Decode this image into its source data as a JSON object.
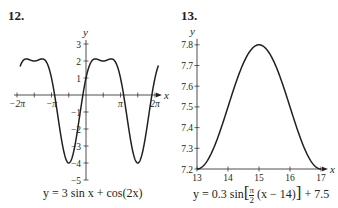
{
  "problems": [
    {
      "number": "12.",
      "caption": "y = 3 sin x + cos(2x)"
    },
    {
      "number": "13.",
      "caption_pre": "y = 0.3 sin",
      "caption_frac_num": "π",
      "caption_frac_den": "2",
      "caption_mid": "(x − 14)",
      "caption_post": "+ 7.5"
    }
  ],
  "chart_data": [
    {
      "type": "line",
      "title": "12.",
      "function": "y = 3 sin x + cos(2x)",
      "xlabel": "x",
      "ylabel": "y",
      "xlim": [
        -6.283,
        6.6
      ],
      "ylim": [
        -5,
        3
      ],
      "xticks": [
        "-2π",
        "-π",
        "π",
        "2π"
      ],
      "xtick_values": [
        -6.283,
        -3.1416,
        3.1416,
        6.283
      ],
      "yticks": [
        3,
        2,
        1,
        -1,
        -2,
        -3,
        -4,
        -5
      ],
      "grid": false,
      "curve_domain": [
        -6.0,
        6.6
      ],
      "key_points": [
        {
          "x": -4.71,
          "y": 2
        },
        {
          "x": -1.57,
          "y": -4
        },
        {
          "x": 1.57,
          "y": 2
        },
        {
          "x": 4.71,
          "y": -4
        }
      ]
    },
    {
      "type": "line",
      "title": "13.",
      "function": "y = 0.3 sin[π/2 (x − 14)] + 7.5",
      "xlabel": "x",
      "ylabel": "y",
      "xlim": [
        13,
        17
      ],
      "ylim": [
        7.2,
        7.8
      ],
      "xticks": [
        13,
        14,
        15,
        16,
        17
      ],
      "yticks": [
        7.8,
        7.7,
        7.6,
        7.5,
        7.4,
        7.3,
        7.2
      ],
      "grid": false,
      "curve_domain": [
        13,
        17
      ],
      "key_points": [
        {
          "x": 13,
          "y": 7.2
        },
        {
          "x": 15,
          "y": 7.8
        },
        {
          "x": 17,
          "y": 7.2
        }
      ]
    }
  ]
}
